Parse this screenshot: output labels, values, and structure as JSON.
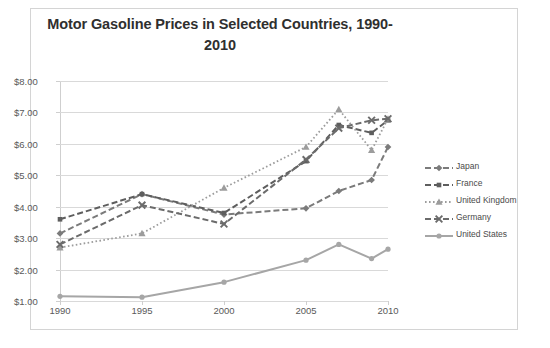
{
  "chart_data": {
    "type": "line",
    "title": "Motor Gasoline Prices in Selected Countries, 1990-2010",
    "xlabel": "",
    "ylabel": "",
    "ylim": [
      1.0,
      8.0
    ],
    "ytick_labels": [
      "$8.00",
      "$7.00",
      "$6.00",
      "$5.00",
      "$4.00",
      "$3.00",
      "$2.00",
      "$1.00"
    ],
    "ytick_values": [
      8.0,
      7.0,
      6.0,
      5.0,
      4.0,
      3.0,
      2.0,
      1.0
    ],
    "xtick_labels": [
      "1990",
      "1995",
      "2000",
      "2005",
      "2010"
    ],
    "xtick_values": [
      1990,
      1995,
      2000,
      2005,
      2010
    ],
    "xlim": [
      1990,
      2010
    ],
    "grid": true,
    "legend_position": "right",
    "x": [
      1990,
      1995,
      2000,
      2005,
      2007,
      2009,
      2010
    ],
    "series": [
      {
        "name": "Japan",
        "marker": "diamond",
        "line_style": "dashed",
        "color": "#7b7b7b",
        "values": [
          3.15,
          4.4,
          3.75,
          3.95,
          4.5,
          4.85,
          5.9
        ]
      },
      {
        "name": "France",
        "marker": "square",
        "line_style": "dashed",
        "color": "#5e5e5e",
        "values": [
          3.6,
          4.4,
          3.8,
          5.45,
          6.6,
          6.35,
          6.75
        ]
      },
      {
        "name": "United Kingdom",
        "marker": "triangle",
        "line_style": "dotted",
        "color": "#9c9c9c",
        "values": [
          2.7,
          3.15,
          4.6,
          5.9,
          7.1,
          5.8,
          6.8
        ]
      },
      {
        "name": "Germany",
        "marker": "x",
        "line_style": "dashed",
        "color": "#6b6b6b",
        "values": [
          2.8,
          4.05,
          3.45,
          5.5,
          6.5,
          6.75,
          6.8
        ]
      },
      {
        "name": "United States",
        "marker": "circle",
        "line_style": "solid",
        "color": "#a6a6a6",
        "values": [
          1.15,
          1.12,
          1.6,
          2.3,
          2.8,
          2.35,
          2.65
        ]
      }
    ]
  },
  "legend": {
    "items": [
      {
        "label": "Japan"
      },
      {
        "label": "France"
      },
      {
        "label": "United Kingdom"
      },
      {
        "label": "Germany"
      },
      {
        "label": "United States"
      }
    ]
  }
}
